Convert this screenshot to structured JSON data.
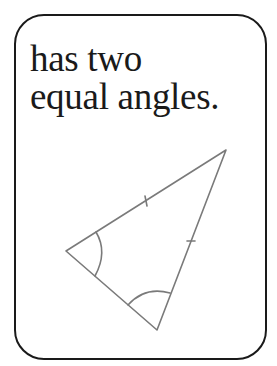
{
  "card": {
    "caption_lines": [
      "has two",
      "equal angles."
    ],
    "border_color": "#1a1a1a",
    "line_color": "#777777"
  },
  "figure": {
    "shape": "isosceles-triangle",
    "vertices": [
      [
        226,
        150
      ],
      [
        66,
        251
      ],
      [
        157,
        330
      ]
    ],
    "equal_side_tick_marks": 2,
    "equal_angle_arcs": 2
  }
}
